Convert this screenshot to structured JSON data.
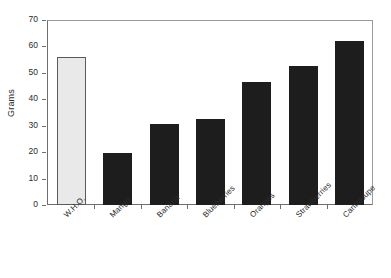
{
  "chart_data": {
    "type": "bar",
    "title": "",
    "subtitle": "",
    "xlabel": "",
    "ylabel": "Grams",
    "ylim": [
      0,
      70
    ],
    "ytick_step": 10,
    "grid": false,
    "legend": "none",
    "categories": [
      "W.H.O.",
      "Mango",
      "Banana",
      "Blueberries",
      "Oranges",
      "Strawberries",
      "Cantaloupe"
    ],
    "values": [
      56,
      19.5,
      30.5,
      32.5,
      46.5,
      52.5,
      62
    ],
    "ytick_labels": [
      "0",
      "10",
      "20",
      "30",
      "40",
      "50",
      "60",
      "70"
    ],
    "bar_colors": [
      "#e9e9e9",
      "#1d1d1d",
      "#1d1d1d",
      "#1d1d1d",
      "#1d1d1d",
      "#1d1d1d",
      "#1d1d1d"
    ],
    "bar_border_colors": [
      "#5a5a5a",
      "#1d1d1d",
      "#1d1d1d",
      "#1d1d1d",
      "#1d1d1d",
      "#1d1d1d",
      "#1d1d1d"
    ],
    "reference_category": "W.H.O.",
    "axis_color": "#6e6e6e",
    "frame_color": "#9a9a9a",
    "text_color": "#2b2b2b",
    "background": "#ffffff"
  }
}
